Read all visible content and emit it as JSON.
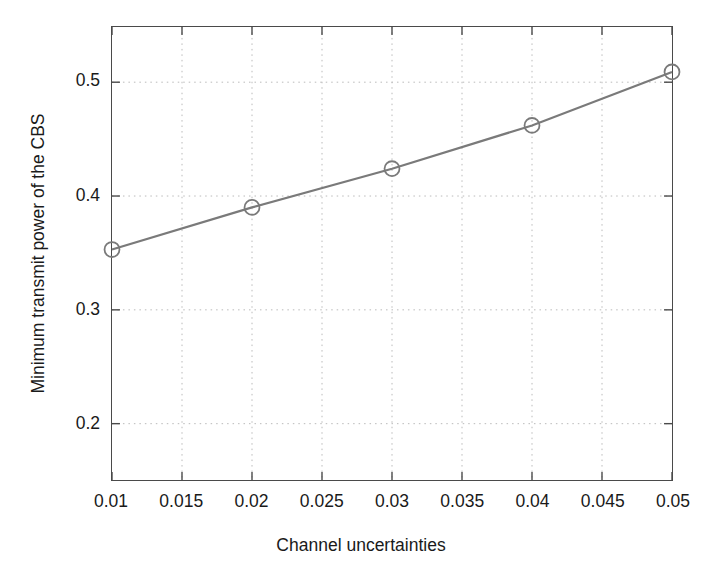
{
  "chart_data": {
    "type": "line",
    "title": "",
    "subtitle": "",
    "xlabel": "Channel uncertainties",
    "ylabel": "Minimum transmit power of the CBS",
    "x": [
      0.01,
      0.02,
      0.03,
      0.04,
      0.05
    ],
    "values": [
      0.353,
      0.39,
      0.424,
      0.462,
      0.509
    ],
    "series": [
      {
        "name": "Minimum transmit power",
        "x": [
          0.01,
          0.02,
          0.03,
          0.04,
          0.05
        ],
        "values": [
          0.353,
          0.39,
          0.424,
          0.462,
          0.509
        ]
      }
    ],
    "xlim": [
      0.01,
      0.05
    ],
    "ylim": [
      0.1505,
      0.5485
    ],
    "xticks": [
      0.01,
      0.015,
      0.02,
      0.025,
      0.03,
      0.035,
      0.04,
      0.045,
      0.05
    ],
    "xtick_labels": [
      "0.01",
      "0.015",
      "0.02",
      "0.025",
      "0.03",
      "0.035",
      "0.04",
      "0.045",
      "0.05"
    ],
    "yticks": [
      0.2,
      0.3,
      0.4,
      0.5
    ],
    "ytick_labels": [
      "0.2",
      "0.3",
      "0.4",
      "0.5"
    ],
    "grid": true,
    "grid_style": "dotted",
    "legend": null,
    "legend_position": "none",
    "marker": "circle-open",
    "line_color": "#7a7a7a",
    "marker_color": "#7a7a7a",
    "grid_color": "#b9b9b9",
    "axis_color": "#4a4a4a",
    "background_color": "#ffffff",
    "text_color": "#1a1a1a"
  }
}
